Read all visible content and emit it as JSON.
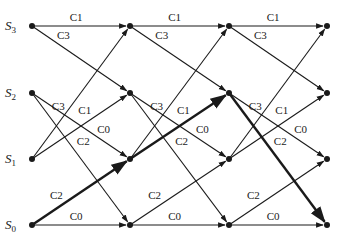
{
  "diagram": {
    "type": "trellis",
    "states": [
      {
        "id": "S3",
        "label": "S",
        "sub": "3"
      },
      {
        "id": "S2",
        "label": "S",
        "sub": "2"
      },
      {
        "id": "S1",
        "label": "S",
        "sub": "1"
      },
      {
        "id": "S0",
        "label": "S",
        "sub": "0"
      }
    ],
    "columns": 4,
    "transitions": [
      {
        "from": "S3",
        "to": "S3",
        "label": "C1"
      },
      {
        "from": "S3",
        "to": "S2",
        "label": "C3"
      },
      {
        "from": "S2",
        "to": "S1",
        "label": "C0"
      },
      {
        "from": "S2",
        "to": "S0",
        "label": "C2"
      },
      {
        "from": "S1",
        "to": "S3",
        "label": "C3"
      },
      {
        "from": "S1",
        "to": "S2",
        "label": "C1"
      },
      {
        "from": "S0",
        "to": "S1",
        "label": "C2"
      },
      {
        "from": "S0",
        "to": "S0",
        "label": "C0"
      }
    ],
    "highlighted_path": [
      "S0",
      "S1",
      "S2",
      "S0"
    ],
    "edge_labels": {
      "s3_s3": "C1",
      "s3_s2": "C3",
      "s1_s3": "C3",
      "s1_s2": "C1",
      "s2_s1": "C0",
      "s2_s0": "C2",
      "s0_s1": "C2",
      "s0_s0": "C0"
    }
  }
}
